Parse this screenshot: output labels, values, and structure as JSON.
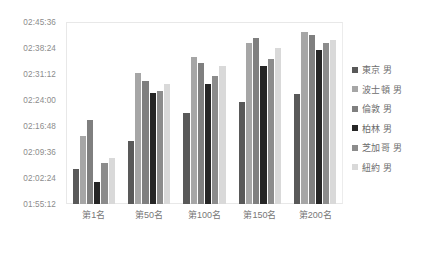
{
  "chart_data": {
    "type": "bar",
    "title": "",
    "subtitle": "",
    "xlabel": "",
    "ylabel": "",
    "grid": false,
    "legend_position": "right",
    "categories": [
      "第1名",
      "第50名",
      "第100名",
      "第150名",
      "第200名"
    ],
    "y_tick_labels": [
      "02:45:36",
      "02:38:24",
      "02:31:12",
      "02:24:00",
      "02:16:48",
      "02:09:36",
      "02:02:24",
      "01:55:12"
    ],
    "y_tick_seconds": [
      9936,
      9504,
      9072,
      8640,
      8208,
      7776,
      7344,
      6912
    ],
    "ylim_seconds": [
      6912,
      9936
    ],
    "ylim": [
      "01:55:12",
      "02:45:36"
    ],
    "y_tick_step_seconds": 432,
    "value_unit": "hh:mm:ss",
    "series": [
      {
        "name": "東京 男",
        "color": "#595959",
        "values": [
          "02:04:56",
          "02:12:40",
          "02:20:19",
          "02:23:35",
          "02:25:44"
        ],
        "values_seconds": [
          7496,
          7960,
          8419,
          8615,
          8744
        ]
      },
      {
        "name": "波士頓 男",
        "color": "#a6a6a6",
        "values": [
          "02:14:10",
          "02:31:26",
          "02:35:50",
          "02:39:50",
          "02:42:43"
        ],
        "values_seconds": [
          8050,
          9086,
          9350,
          9590,
          9763
        ]
      },
      {
        "name": "倫敦 男",
        "color": "#7f7f7f",
        "values": [
          "02:18:29",
          "02:29:17",
          "02:34:19",
          "02:41:17",
          "02:42:00"
        ],
        "values_seconds": [
          8309,
          8957,
          9259,
          9677,
          9720
        ]
      },
      {
        "name": "柏林 男",
        "color": "#262626",
        "values": [
          "02:01:26",
          "02:25:55",
          "02:28:19",
          "02:33:22",
          "02:37:55"
        ],
        "values_seconds": [
          7286,
          8755,
          8899,
          9202,
          9475
        ]
      },
      {
        "name": "芝加哥 男",
        "color": "#8c8c8c",
        "values": [
          "02:06:29",
          "02:26:38",
          "02:30:43",
          "02:35:26",
          "02:39:50"
        ],
        "values_seconds": [
          7589,
          8798,
          9043,
          9326,
          9590
        ]
      },
      {
        "name": "紐約 男",
        "color": "#d9d9d9",
        "values": [
          "02:07:55",
          "02:28:34",
          "02:33:22",
          "02:38:24",
          "02:40:34"
        ],
        "values_seconds": [
          7675,
          8914,
          9202,
          9504,
          9634
        ]
      }
    ]
  },
  "legend": {
    "items": [
      {
        "label": "東京 男",
        "color": "#595959"
      },
      {
        "label": "波士頓 男",
        "color": "#a6a6a6"
      },
      {
        "label": "倫敦 男",
        "color": "#7f7f7f"
      },
      {
        "label": "柏林 男",
        "color": "#262626"
      },
      {
        "label": "芝加哥 男",
        "color": "#8c8c8c"
      },
      {
        "label": "紐約 男",
        "color": "#d9d9d9"
      }
    ]
  },
  "style": {
    "background": "#ffffff",
    "axis_text_color": "#8c8c8c",
    "frame_color": "#e8e8e8"
  }
}
